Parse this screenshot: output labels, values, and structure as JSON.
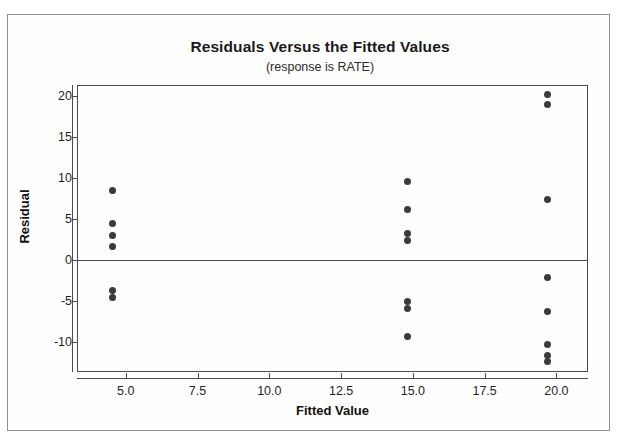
{
  "chart_data": {
    "type": "scatter",
    "title": "Residuals Versus the Fitted Values",
    "subtitle": "(response is RATE)",
    "xlabel": "Fitted Value",
    "ylabel": "Residual",
    "xlim": [
      3.3,
      21.1
    ],
    "ylim": [
      -13.6,
      21.3
    ],
    "xticks": [
      5.0,
      7.5,
      10.0,
      12.5,
      15.0,
      17.5,
      20.0
    ],
    "xtick_labels": [
      "5.0",
      "7.5",
      "10.0",
      "12.5",
      "15.0",
      "17.5",
      "20.0"
    ],
    "yticks": [
      20,
      15,
      10,
      5,
      0,
      -5,
      -10
    ],
    "ytick_labels": [
      "20",
      "15",
      "10",
      "5",
      "0",
      "-5",
      "-10"
    ],
    "grid": false,
    "legend": false,
    "reference_line": {
      "axis": "y",
      "value": 0
    },
    "marker_color": "#3b3b3b",
    "points": [
      {
        "x": 4.55,
        "y": 8.5
      },
      {
        "x": 4.55,
        "y": 4.5
      },
      {
        "x": 4.55,
        "y": 3.0
      },
      {
        "x": 4.55,
        "y": 1.7
      },
      {
        "x": 4.55,
        "y": -3.7
      },
      {
        "x": 4.55,
        "y": -4.6
      },
      {
        "x": 14.8,
        "y": 9.6
      },
      {
        "x": 14.8,
        "y": 6.2
      },
      {
        "x": 14.8,
        "y": 3.2
      },
      {
        "x": 14.8,
        "y": 2.4
      },
      {
        "x": 14.8,
        "y": -5.0
      },
      {
        "x": 14.8,
        "y": -5.9
      },
      {
        "x": 14.8,
        "y": -9.3
      },
      {
        "x": 19.7,
        "y": 20.1
      },
      {
        "x": 19.7,
        "y": 18.9
      },
      {
        "x": 19.7,
        "y": 7.4
      },
      {
        "x": 19.7,
        "y": -2.1
      },
      {
        "x": 19.7,
        "y": -6.2
      },
      {
        "x": 19.7,
        "y": -10.2
      },
      {
        "x": 19.7,
        "y": -11.6
      },
      {
        "x": 19.7,
        "y": -12.3
      }
    ]
  }
}
